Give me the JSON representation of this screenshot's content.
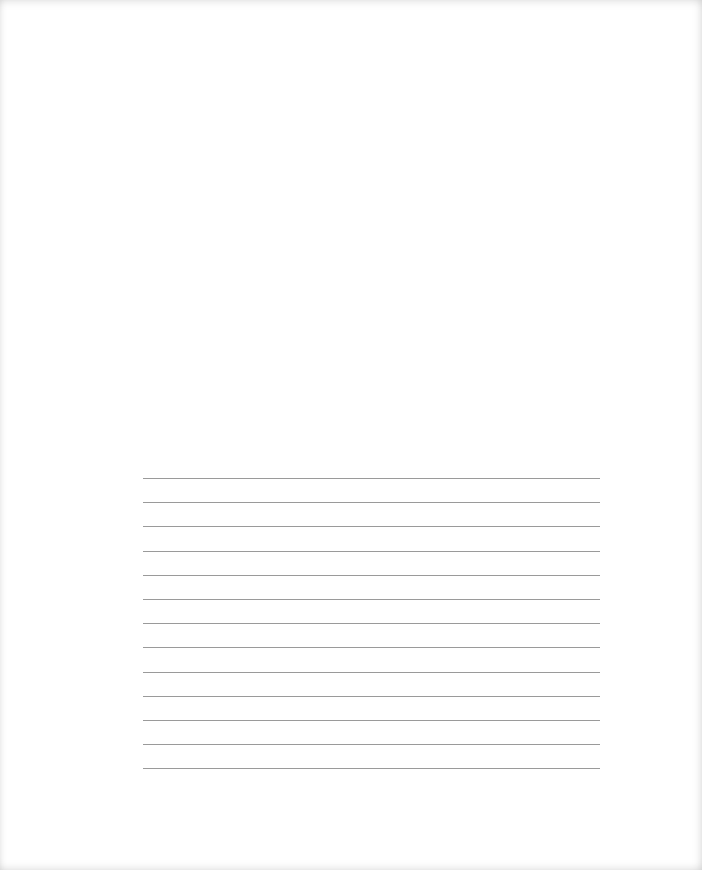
{
  "page": {
    "background": "#ffffff",
    "line_color": "#9a9a9a",
    "ruled_lines": {
      "count": 13,
      "start_y": 478,
      "spacing_px": 24.2,
      "left_x": 143,
      "right_x": 600
    }
  }
}
